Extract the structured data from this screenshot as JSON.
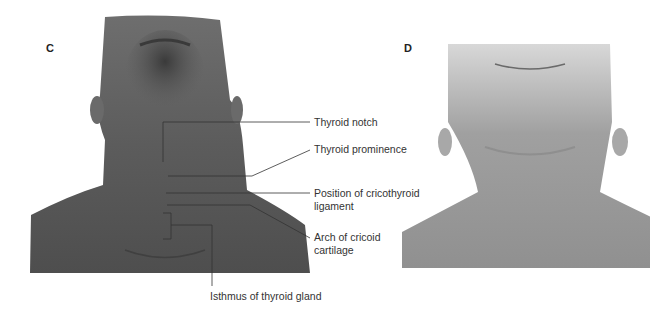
{
  "panels": {
    "c": {
      "letter": "C"
    },
    "d": {
      "letter": "D"
    }
  },
  "labels": {
    "thyroid_notch": "Thyroid notch",
    "thyroid_prominence": "Thyroid prominence",
    "cricothyroid_line1": "Position of cricothyroid",
    "cricothyroid_line2": "ligament",
    "cricoid_line1": "Arch of cricoid",
    "cricoid_line2": "cartilage",
    "isthmus": "Isthmus of thyroid gland"
  },
  "colors": {
    "background": "#ffffff",
    "leader": "#333333",
    "photo_c_skin": "#5a5a5a",
    "photo_d_skin": "#a8a8a8"
  }
}
